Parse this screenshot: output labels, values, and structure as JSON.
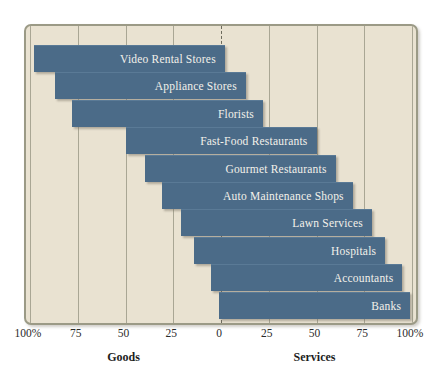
{
  "chart_data": {
    "type": "bar",
    "orientation": "horizontal",
    "style": "diverging-stacked-100",
    "title": "",
    "subtitle": "",
    "xlabel": "",
    "ylabel": "",
    "grid": true,
    "legend_position": "none",
    "axis": {
      "left_label": "Goods",
      "right_label": "Services",
      "ticks": [
        {
          "label": "100%",
          "value": -100
        },
        {
          "label": "75",
          "value": -75
        },
        {
          "label": "50",
          "value": -50
        },
        {
          "label": "25",
          "value": -25
        },
        {
          "label": "0",
          "value": 0
        },
        {
          "label": "25",
          "value": 25
        },
        {
          "label": "50",
          "value": 50
        },
        {
          "label": "75",
          "value": 75
        },
        {
          "label": "100%",
          "value": 100
        }
      ],
      "xlim": [
        -100,
        100
      ]
    },
    "categories": [
      "Video Rental Stores",
      "Appliance Stores",
      "Florists",
      "Fast-Food Restaurants",
      "Gourmet Restaurants",
      "Auto Maintenance Shops",
      "Lawn Services",
      "Hospitals",
      "Accountants",
      "Banks"
    ],
    "series": [
      {
        "name": "Goods",
        "values": [
          98,
          87,
          78,
          50,
          40,
          31,
          21,
          14,
          5,
          1
        ]
      },
      {
        "name": "Services",
        "values": [
          2,
          13,
          22,
          50,
          60,
          69,
          79,
          86,
          95,
          99
        ]
      }
    ],
    "bars": [
      {
        "label": "Video Rental Stores",
        "goods": 98,
        "services": 2
      },
      {
        "label": "Appliance Stores",
        "goods": 87,
        "services": 13
      },
      {
        "label": "Florists",
        "goods": 78,
        "services": 22
      },
      {
        "label": "Fast-Food Restaurants",
        "goods": 50,
        "services": 50
      },
      {
        "label": "Gourmet Restaurants",
        "goods": 40,
        "services": 60
      },
      {
        "label": "Auto Maintenance Shops",
        "goods": 31,
        "services": 69
      },
      {
        "label": "Lawn Services",
        "goods": 21,
        "services": 79
      },
      {
        "label": "Hospitals",
        "goods": 14,
        "services": 86
      },
      {
        "label": "Accountants",
        "goods": 5,
        "services": 95
      },
      {
        "label": "Banks",
        "goods": 1,
        "services": 99
      }
    ],
    "colors": {
      "bar": "#4b6b88",
      "bar_label_text": "#f3f1ea",
      "plot_background": "#e9e2d1",
      "plot_border": "#9b9a86",
      "gridline": "#a9a694",
      "center_line": "#6c6a5c",
      "axis_text": "#2b2b2b"
    }
  }
}
